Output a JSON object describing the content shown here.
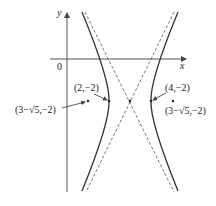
{
  "diagram": {
    "type": "hyperbola",
    "axes": {
      "x_label": "x",
      "y_label": "y",
      "origin_label": "0"
    },
    "points": [
      {
        "label": "(2,−2)",
        "role": "vertex"
      },
      {
        "label": "(4,−2)",
        "role": "vertex"
      },
      {
        "label": "(3−√5,−2)",
        "role": "focus-left"
      },
      {
        "label": "(3−√5,−2)",
        "role": "focus-right"
      }
    ],
    "center": "(3,−2)",
    "colors": {
      "curve": "#333333",
      "asymptote": "#555555",
      "axis": "#444444"
    }
  }
}
